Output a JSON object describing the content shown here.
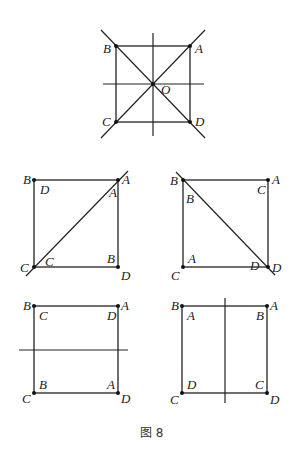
{
  "figure": {
    "caption": "图 8",
    "panels": [
      {
        "id": "top",
        "outer_labels": {
          "top_left": "B",
          "top_right": "A",
          "bottom_left": "C",
          "bottom_right": "D"
        },
        "center_label": "O",
        "axes": [
          "horizontal",
          "vertical",
          "diagonal-BD",
          "diagonal-AC"
        ]
      },
      {
        "id": "middle-left",
        "outer_labels": {
          "top_left": "B",
          "top_right": "A",
          "bottom_left": "C",
          "bottom_right": "D"
        },
        "inner_labels": {
          "top_left": "D",
          "top_right": "A",
          "bottom_left": "C",
          "bottom_right": "B"
        },
        "axis": "diagonal-AC"
      },
      {
        "id": "middle-right",
        "outer_labels": {
          "top_left": "B",
          "top_right": "A",
          "bottom_left": "C",
          "bottom_right": "D"
        },
        "inner_labels": {
          "top_left": "B",
          "top_right": "C",
          "bottom_left": "A",
          "bottom_right": "D"
        },
        "axis": "diagonal-BD"
      },
      {
        "id": "bottom-left",
        "outer_labels": {
          "top_left": "B",
          "top_right": "A",
          "bottom_left": "C",
          "bottom_right": "D"
        },
        "inner_labels": {
          "top_left": "C",
          "top_right": "D",
          "bottom_left": "B",
          "bottom_right": "A"
        },
        "axis": "horizontal"
      },
      {
        "id": "bottom-right",
        "outer_labels": {
          "top_left": "B",
          "top_right": "A",
          "bottom_left": "C",
          "bottom_right": "D"
        },
        "inner_labels": {
          "top_left": "A",
          "top_right": "B",
          "bottom_left": "D",
          "bottom_right": "C"
        },
        "axis": "vertical"
      }
    ]
  }
}
